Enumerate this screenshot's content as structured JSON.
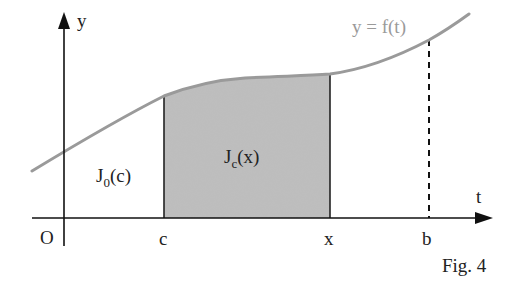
{
  "figure": {
    "caption": "Fig. 4",
    "curve_label": "y = f(t)",
    "axes": {
      "y_label": "y",
      "x_label": "t",
      "origin_label": "O"
    },
    "ticks": {
      "c": "c",
      "x": "x",
      "b": "b"
    },
    "regions": {
      "left_area": {
        "label_main": "J",
        "label_sub": "0",
        "label_arg": "(c)",
        "fill": "#ffffff"
      },
      "shaded_area": {
        "label_main": "J",
        "label_sub": "c",
        "label_arg": "(x)",
        "fill": "#bdbdbd"
      }
    },
    "colors": {
      "axis": "#111111",
      "curve": "#9a9a9a",
      "shade": "#bdbdbd",
      "dashed": "#111111"
    }
  }
}
